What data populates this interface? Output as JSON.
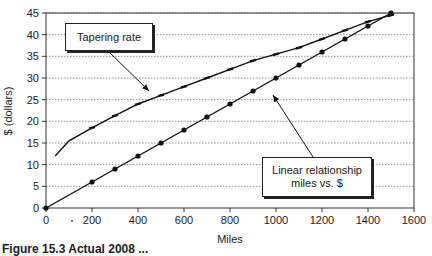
{
  "chart_data": {
    "type": "line",
    "title": "",
    "xlabel": "Miles",
    "ylabel": "$ (dollars)",
    "xlim": [
      0,
      1600
    ],
    "ylim": [
      0,
      45
    ],
    "x_ticks": [
      0,
      200,
      400,
      600,
      800,
      1000,
      1200,
      1400,
      1600
    ],
    "y_ticks": [
      0,
      5,
      10,
      15,
      20,
      25,
      30,
      35,
      40,
      45
    ],
    "grid": "horizontal dotted",
    "legend": "none (callout annotations)",
    "series": [
      {
        "name": "Tapering rate",
        "marker": "dash",
        "x": [
          40,
          100,
          200,
          300,
          400,
          500,
          600,
          700,
          800,
          900,
          1000,
          1100,
          1200,
          1300,
          1400,
          1500
        ],
        "values": [
          12,
          15.5,
          18.5,
          21.3,
          24,
          26,
          28,
          30,
          32,
          34,
          35.5,
          37,
          39,
          41,
          43,
          44.5
        ]
      },
      {
        "name": "Linear relationship miles vs. $",
        "marker": "circle",
        "x": [
          0,
          200,
          300,
          400,
          500,
          600,
          700,
          800,
          900,
          1000,
          1100,
          1200,
          1300,
          1400,
          1500
        ],
        "values": [
          0,
          6,
          9,
          12,
          15,
          18,
          21,
          24,
          27,
          30,
          33,
          36,
          39,
          42,
          45
        ]
      }
    ],
    "annotations": [
      {
        "text": "Tapering rate",
        "points_to": "Tapering rate series"
      },
      {
        "text": "Linear relationship\nmiles vs. $",
        "points_to": "Linear series"
      }
    ]
  },
  "labels": {
    "xlabel": "Miles",
    "ylabel": "$ (dollars)",
    "callout_tapering": "Tapering rate",
    "callout_linear_line1": "Linear relationship",
    "callout_linear_line2": "miles vs. $",
    "caption": "Figure 15.3  Actual 2008 ..."
  }
}
